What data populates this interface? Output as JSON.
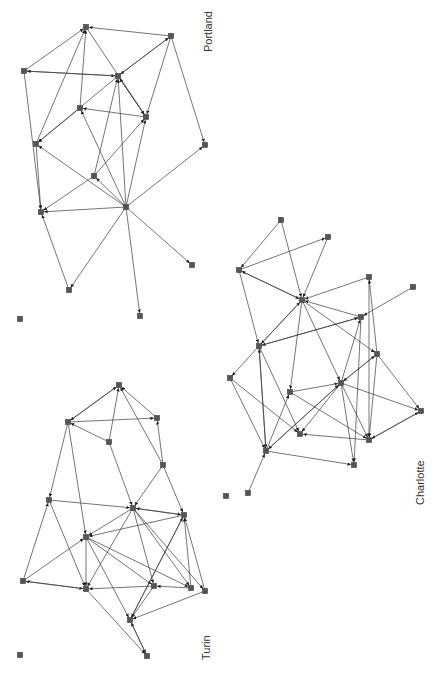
{
  "colors": {
    "edge": "#3a3a3a",
    "node": "#555555",
    "text": "#333333",
    "background": "#ffffff"
  },
  "networks": [
    {
      "name": "Portland",
      "label": {
        "text": "Portland",
        "x": 212,
        "y": 52
      },
      "nodes": {
        "A": [
          86,
          27
        ],
        "B": [
          171,
          36
        ],
        "C": [
          24,
          71
        ],
        "D": [
          118,
          76
        ],
        "E": [
          80,
          108
        ],
        "F": [
          146,
          117
        ],
        "G": [
          36,
          144
        ],
        "H": [
          205,
          145
        ],
        "I": [
          94,
          176
        ],
        "J": [
          126,
          207
        ],
        "K": [
          41,
          212
        ],
        "L": [
          192,
          265
        ],
        "M": [
          69,
          290
        ],
        "N": [
          140,
          316
        ],
        "O": [
          20,
          319
        ]
      },
      "edges": [
        [
          "B",
          "A"
        ],
        [
          "C",
          "A"
        ],
        [
          "C",
          "D"
        ],
        [
          "D",
          "C"
        ],
        [
          "B",
          "D"
        ],
        [
          "D",
          "B"
        ],
        [
          "A",
          "F"
        ],
        [
          "D",
          "F"
        ],
        [
          "F",
          "D"
        ],
        [
          "F",
          "E"
        ],
        [
          "E",
          "A"
        ],
        [
          "G",
          "A"
        ],
        [
          "E",
          "G"
        ],
        [
          "D",
          "G"
        ],
        [
          "C",
          "K"
        ],
        [
          "G",
          "K"
        ],
        [
          "B",
          "F"
        ],
        [
          "B",
          "H"
        ],
        [
          "I",
          "D"
        ],
        [
          "I",
          "K"
        ],
        [
          "I",
          "F"
        ],
        [
          "J",
          "I"
        ],
        [
          "J",
          "E"
        ],
        [
          "J",
          "G"
        ],
        [
          "J",
          "K"
        ],
        [
          "J",
          "D"
        ],
        [
          "J",
          "F"
        ],
        [
          "J",
          "H"
        ],
        [
          "J",
          "L"
        ],
        [
          "J",
          "M"
        ],
        [
          "J",
          "N"
        ],
        [
          "M",
          "K"
        ]
      ]
    },
    {
      "name": "Turin",
      "label": {
        "text": "Turin",
        "x": 210,
        "y": 660
      },
      "nodes": {
        "a": [
          119,
          385
        ],
        "b": [
          68,
          422
        ],
        "c": [
          157,
          418
        ],
        "d": [
          109,
          442
        ],
        "e": [
          163,
          465
        ],
        "f": [
          49,
          500
        ],
        "g": [
          133,
          508
        ],
        "h": [
          184,
          515
        ],
        "i": [
          86,
          537
        ],
        "j": [
          23,
          581
        ],
        "k": [
          86,
          589
        ],
        "l": [
          154,
          586
        ],
        "m": [
          191,
          588
        ],
        "n": [
          205,
          591
        ],
        "o": [
          130,
          620
        ],
        "p": [
          147,
          656
        ],
        "q": [
          20,
          655
        ]
      },
      "edges": [
        [
          "b",
          "a"
        ],
        [
          "a",
          "b"
        ],
        [
          "b",
          "c"
        ],
        [
          "d",
          "b"
        ],
        [
          "d",
          "a"
        ],
        [
          "c",
          "a"
        ],
        [
          "e",
          "c"
        ],
        [
          "e",
          "a"
        ],
        [
          "e",
          "g"
        ],
        [
          "e",
          "h"
        ],
        [
          "b",
          "f"
        ],
        [
          "b",
          "i"
        ],
        [
          "f",
          "g"
        ],
        [
          "f",
          "k"
        ],
        [
          "g",
          "h"
        ],
        [
          "h",
          "g"
        ],
        [
          "h",
          "i"
        ],
        [
          "g",
          "i"
        ],
        [
          "j",
          "f"
        ],
        [
          "j",
          "i"
        ],
        [
          "j",
          "k"
        ],
        [
          "k",
          "j"
        ],
        [
          "i",
          "k"
        ],
        [
          "i",
          "l"
        ],
        [
          "i",
          "o"
        ],
        [
          "i",
          "m"
        ],
        [
          "g",
          "k"
        ],
        [
          "g",
          "l"
        ],
        [
          "g",
          "m"
        ],
        [
          "g",
          "n"
        ],
        [
          "l",
          "k"
        ],
        [
          "m",
          "l"
        ],
        [
          "h",
          "o"
        ],
        [
          "n",
          "o"
        ],
        [
          "n",
          "h"
        ],
        [
          "m",
          "h"
        ],
        [
          "l",
          "o"
        ],
        [
          "o",
          "h"
        ],
        [
          "k",
          "p"
        ],
        [
          "o",
          "p"
        ],
        [
          "p",
          "o"
        ],
        [
          "d",
          "g"
        ]
      ]
    },
    {
      "name": "Charlotte",
      "label": {
        "text": "Charlotte",
        "x": 424,
        "y": 505
      },
      "nodes": {
        "P1": [
          281,
          220
        ],
        "P2": [
          328,
          237
        ],
        "P3": [
          239,
          270
        ],
        "P4": [
          369,
          277
        ],
        "P5": [
          413,
          287
        ],
        "P6": [
          302,
          300
        ],
        "P7": [
          361,
          317
        ],
        "P8": [
          259,
          346
        ],
        "P9": [
          377,
          354
        ],
        "P10": [
          230,
          378
        ],
        "P11": [
          341,
          383
        ],
        "P12": [
          290,
          392
        ],
        "P13": [
          421,
          411
        ],
        "P14": [
          300,
          434
        ],
        "P15": [
          369,
          440
        ],
        "P16": [
          266,
          451
        ],
        "P17": [
          354,
          465
        ],
        "P18": [
          248,
          493
        ],
        "P19": [
          226,
          496
        ]
      },
      "edges": [
        [
          "P1",
          "P3"
        ],
        [
          "P1",
          "P6"
        ],
        [
          "P3",
          "P2"
        ],
        [
          "P2",
          "P6"
        ],
        [
          "P3",
          "P6"
        ],
        [
          "P6",
          "P3"
        ],
        [
          "P4",
          "P6"
        ],
        [
          "P4",
          "P15"
        ],
        [
          "P7",
          "P6"
        ],
        [
          "P7",
          "P8"
        ],
        [
          "P5",
          "P7"
        ],
        [
          "P3",
          "P8"
        ],
        [
          "P8",
          "P6"
        ],
        [
          "P6",
          "P8"
        ],
        [
          "P6",
          "P9"
        ],
        [
          "P6",
          "P11"
        ],
        [
          "P6",
          "P12"
        ],
        [
          "P9",
          "P4"
        ],
        [
          "P8",
          "P10"
        ],
        [
          "P8",
          "P14"
        ],
        [
          "P8",
          "P16"
        ],
        [
          "P10",
          "P14"
        ],
        [
          "P10",
          "P16"
        ],
        [
          "P11",
          "P7"
        ],
        [
          "P11",
          "P9"
        ],
        [
          "P9",
          "P11"
        ],
        [
          "P12",
          "P11"
        ],
        [
          "P11",
          "P13"
        ],
        [
          "P11",
          "P14"
        ],
        [
          "P11",
          "P15"
        ],
        [
          "P11",
          "P16"
        ],
        [
          "P11",
          "P17"
        ],
        [
          "P12",
          "P15"
        ],
        [
          "P7",
          "P17"
        ],
        [
          "P9",
          "P15"
        ],
        [
          "P13",
          "P15"
        ],
        [
          "P15",
          "P13"
        ],
        [
          "P15",
          "P14"
        ],
        [
          "P16",
          "P12"
        ],
        [
          "P16",
          "P11"
        ],
        [
          "P16",
          "P17"
        ],
        [
          "P16",
          "P8"
        ],
        [
          "P18",
          "P16"
        ],
        [
          "P9",
          "P13"
        ],
        [
          "P8",
          "P7"
        ]
      ]
    }
  ],
  "isolated_nodes_note": "O, q, P19 have no edges"
}
